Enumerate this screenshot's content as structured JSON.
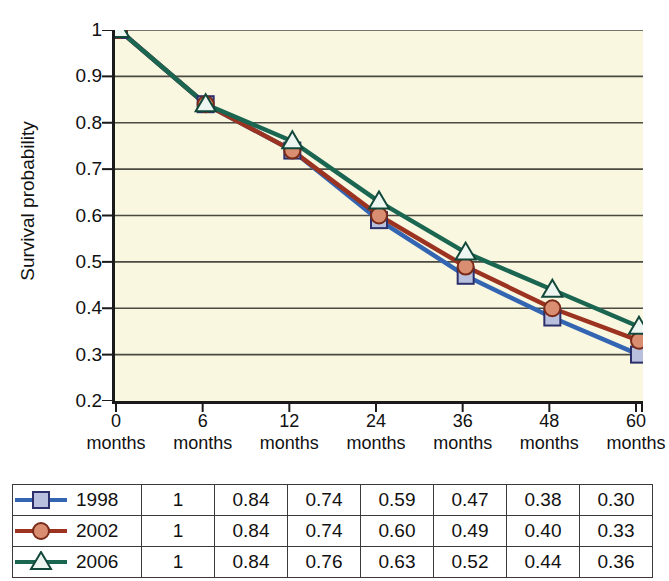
{
  "chart_data": {
    "type": "line",
    "title": "",
    "xlabel": "",
    "ylabel": "Survival probability",
    "categories": [
      "0 months",
      "6 months",
      "12 months",
      "24 months",
      "36 months",
      "48 months",
      "60 months"
    ],
    "x_tick_numbers": [
      "0",
      "6",
      "12",
      "24",
      "36",
      "48",
      "60"
    ],
    "x_tick_unit": "months",
    "ylim": [
      0.2,
      1.0
    ],
    "y_ticks": [
      "1",
      "0.9",
      "0.8",
      "0.7",
      "0.6",
      "0.5",
      "0.4",
      "0.3",
      "0.2"
    ],
    "y_tick_values": [
      1,
      0.9,
      0.8,
      0.7,
      0.6,
      0.5,
      0.4,
      0.3,
      0.2
    ],
    "grid": true,
    "legend_position": "table-below",
    "plot_background": "#f9f7e0",
    "series": [
      {
        "name": "1998",
        "values": [
          1,
          0.84,
          0.74,
          0.59,
          0.47,
          0.38,
          0.3
        ],
        "labels": [
          "1",
          "0.84",
          "0.74",
          "0.59",
          "0.47",
          "0.38",
          "0.30"
        ],
        "line_color": "#3365b2",
        "marker": "square",
        "marker_fill": "#b9c0de",
        "marker_stroke": "#2b2f6b"
      },
      {
        "name": "2002",
        "values": [
          1,
          0.84,
          0.74,
          0.6,
          0.49,
          0.4,
          0.33
        ],
        "labels": [
          "1",
          "0.84",
          "0.74",
          "0.60",
          "0.49",
          "0.40",
          "0.33"
        ],
        "line_color": "#9b3320",
        "marker": "circle",
        "marker_fill": "#d98e72",
        "marker_stroke": "#7a2a18"
      },
      {
        "name": "2006",
        "values": [
          1,
          0.84,
          0.76,
          0.63,
          0.52,
          0.44,
          0.36
        ],
        "labels": [
          "1",
          "0.84",
          "0.76",
          "0.63",
          "0.52",
          "0.44",
          "0.36"
        ],
        "line_color": "#1a6651",
        "marker": "triangle",
        "marker_fill": "#eef6f2",
        "marker_stroke": "#12483a"
      }
    ]
  },
  "table": {
    "rows": [
      {
        "year": "1998",
        "values": [
          "1",
          "0.84",
          "0.74",
          "0.59",
          "0.47",
          "0.38",
          "0.30"
        ]
      },
      {
        "year": "2002",
        "values": [
          "1",
          "0.84",
          "0.74",
          "0.60",
          "0.49",
          "0.40",
          "0.33"
        ]
      },
      {
        "year": "2006",
        "values": [
          "1",
          "0.84",
          "0.76",
          "0.63",
          "0.52",
          "0.44",
          "0.36"
        ]
      }
    ]
  }
}
